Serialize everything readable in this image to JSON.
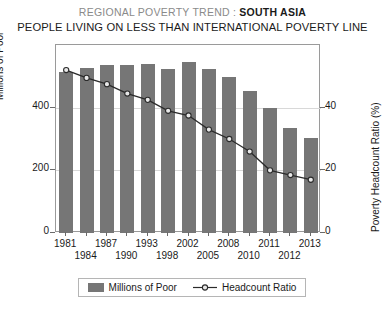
{
  "title": {
    "line1_light": "REGIONAL POVERTY TREND :",
    "line1_bold": "SOUTH ASIA",
    "line2": "PEOPLE LIVING ON LESS THAN INTERNATIONAL POVERTY LINE"
  },
  "legend": {
    "bar_label": "Millions of Poor",
    "line_label": "Headcount Ratio"
  },
  "axes": {
    "left_title": "Millions of Poor",
    "right_title": "Poverty Headcount Ratio (%)",
    "left_ticks": [
      "0",
      "200",
      "400"
    ],
    "right_ticks": [
      "0",
      "20",
      "40"
    ]
  },
  "colors": {
    "bar_fill": "#767676",
    "line_stroke": "#2b2b2b",
    "marker_fill": "#e8e8e8",
    "grid": "#d8d8d8",
    "frame": "#9a9a9a",
    "title_light": "#8a8a8a",
    "title_bold": "#1a1a1a"
  },
  "chart_data": {
    "type": "bar",
    "title": "REGIONAL POVERTY TREND : SOUTH ASIA",
    "subtitle": "PEOPLE LIVING ON LESS THAN INTERNATIONAL POVERTY LINE",
    "xlabel": "",
    "ylabel": "Millions of Poor",
    "y2label": "Poverty Headcount Ratio (%)",
    "ylim": [
      0,
      600
    ],
    "y2lim": [
      0,
      60
    ],
    "yticks": [
      0,
      200,
      400
    ],
    "y2ticks": [
      0,
      20,
      40
    ],
    "grid": true,
    "legend_position": "bottom",
    "categories": [
      "1981",
      "1984",
      "1987",
      "1990",
      "1993",
      "1998",
      "2002",
      "2005",
      "2008",
      "2010",
      "2011",
      "2012",
      "2013"
    ],
    "categories_row_top": [
      "1981",
      "",
      "1987",
      "",
      "1993",
      "",
      "2002",
      "",
      "2008",
      "",
      "2011",
      "",
      "2013"
    ],
    "categories_row_bottom": [
      "",
      "1984",
      "",
      "1990",
      "",
      "1998",
      "",
      "2005",
      "",
      "2010",
      "",
      "2012",
      ""
    ],
    "series": [
      {
        "name": "Millions of Poor",
        "type": "bar",
        "axis": "left",
        "values": [
          515,
          528,
          535,
          535,
          540,
          522,
          547,
          522,
          497,
          453,
          400,
          335,
          303
        ]
      },
      {
        "name": "Headcount Ratio",
        "type": "line",
        "axis": "right",
        "values": [
          52.0,
          49.5,
          47.5,
          44.5,
          42.5,
          39.0,
          37.5,
          33.0,
          30.0,
          26.0,
          20.0,
          18.5,
          17.0
        ]
      }
    ]
  }
}
